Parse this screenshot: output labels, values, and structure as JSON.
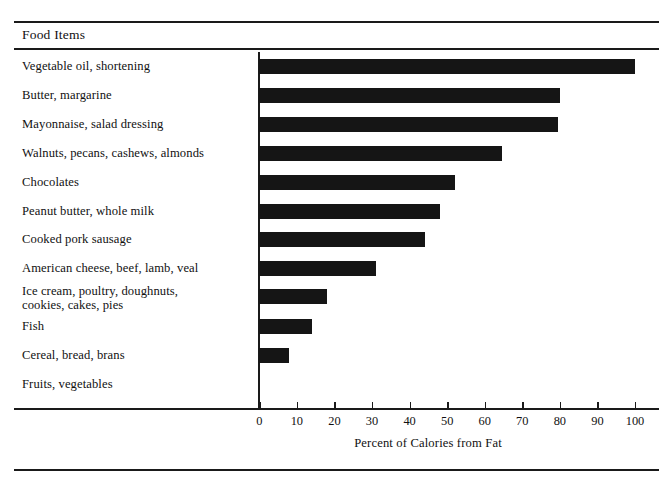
{
  "header": {
    "column_header": "Food Items"
  },
  "chart_data": {
    "type": "bar",
    "orientation": "horizontal",
    "title": "",
    "xlabel": "Percent of Calories from Fat",
    "ylabel": "Food Items",
    "xlim": [
      0,
      100
    ],
    "xticks": [
      0,
      10,
      20,
      30,
      40,
      50,
      60,
      70,
      80,
      90,
      100
    ],
    "xtick_labels": [
      "0",
      "10",
      "20",
      "30",
      "40",
      "50",
      "60",
      "70",
      "80",
      "90",
      "100"
    ],
    "grid": false,
    "legend": null,
    "bar_color": "#151515",
    "categories": [
      "Vegetable oil, shortening",
      "Butter, margarine",
      "Mayonnaise, salad dressing",
      "Walnuts, pecans, cashews, almonds",
      "Chocolates",
      "Peanut butter, whole milk",
      "Cooked pork sausage",
      "American cheese, beef, lamb, veal",
      "Ice cream, poultry, doughnuts, cookies, cakes, pies",
      "Fish",
      "Cereal, bread, brans",
      "Fruits, vegetables"
    ],
    "values": [
      100,
      80,
      79.5,
      64.5,
      52,
      48,
      44,
      31,
      18,
      14,
      8,
      0
    ]
  },
  "rows": [
    {
      "label": "Vegetable oil, shortening",
      "label2": "",
      "value": 100
    },
    {
      "label": "Butter, margarine",
      "label2": "",
      "value": 80
    },
    {
      "label": "Mayonnaise, salad dressing",
      "label2": "",
      "value": 79.5
    },
    {
      "label": "Walnuts, pecans, cashews, almonds",
      "label2": "",
      "value": 64.5
    },
    {
      "label": "Chocolates",
      "label2": "",
      "value": 52
    },
    {
      "label": "Peanut butter, whole milk",
      "label2": "",
      "value": 48
    },
    {
      "label": "Cooked pork sausage",
      "label2": "",
      "value": 44
    },
    {
      "label": "American cheese, beef, lamb, veal",
      "label2": "",
      "value": 31
    },
    {
      "label": "Ice cream, poultry, doughnuts,",
      "label2": "cookies, cakes, pies",
      "value": 18
    },
    {
      "label": "Fish",
      "label2": "",
      "value": 14
    },
    {
      "label": "Cereal, bread, brans",
      "label2": "",
      "value": 8
    },
    {
      "label": "Fruits, vegetables",
      "label2": "",
      "value": 0
    }
  ],
  "axis": {
    "title": "Percent of Calories from Fat",
    "ticks": [
      "0",
      "10",
      "20",
      "30",
      "40",
      "50",
      "60",
      "70",
      "80",
      "90",
      "100"
    ]
  }
}
